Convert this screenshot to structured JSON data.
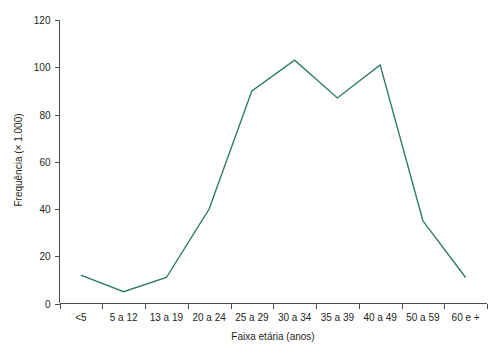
{
  "chart_data": {
    "type": "line",
    "title": "",
    "subtitle": "",
    "xlabel": "Faixa etária (anos)",
    "ylabel": "Frequência (× 1.000)",
    "categories": [
      "<5",
      "5 a 12",
      "13 a 19",
      "20 a 24",
      "25 a 29",
      "30 a 34",
      "35 a 39",
      "40 a 49",
      "50 a 59",
      "60 e +"
    ],
    "values": [
      12,
      5,
      11,
      40,
      90,
      103,
      87,
      101,
      35,
      11
    ],
    "series": [
      {
        "name": "Frequência",
        "color": "#2d7a66",
        "values": [
          12,
          5,
          11,
          40,
          90,
          103,
          87,
          101,
          35,
          11
        ]
      }
    ],
    "ylim": [
      0,
      120
    ],
    "yticks": [
      0,
      20,
      40,
      60,
      80,
      100,
      120
    ],
    "ytick_labels": [
      "0",
      "20",
      "40",
      "60",
      "80",
      "100",
      "120"
    ],
    "grid": false,
    "legend": false,
    "legend_position": "none",
    "axis_color": "#4d4d4d",
    "text_color": "#231f20",
    "background": "#ffffff"
  }
}
